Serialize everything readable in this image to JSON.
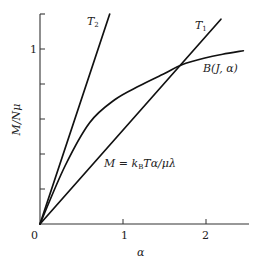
{
  "chart_data": {
    "type": "line",
    "title": "",
    "xlabel": "α",
    "ylabel": "M/Nμ",
    "xlim": [
      0,
      2.55
    ],
    "ylim": [
      0,
      1.2
    ],
    "grid": false,
    "legend": "none (inline labels)",
    "x_ticks": [
      0,
      1,
      2
    ],
    "x_tick_labels": [
      "0",
      "1",
      "2"
    ],
    "y_ticks": [
      0,
      0.2,
      0.4,
      0.6,
      0.8,
      1.0,
      1.2
    ],
    "y_tick_labels": [
      "",
      "",
      "",
      "",
      "",
      "1",
      ""
    ],
    "series": [
      {
        "name": "T2",
        "label": "T₂",
        "kind": "straight line through origin",
        "x": [
          0,
          0.84
        ],
        "y": [
          0,
          1.2
        ],
        "slope": 1.42
      },
      {
        "name": "T1",
        "label": "T₁",
        "kind": "straight line through origin",
        "x": [
          0,
          2.18
        ],
        "y": [
          0,
          1.17
        ],
        "slope": 0.535
      },
      {
        "name": "B(J, α)",
        "label": "B(J, α)",
        "kind": "saturating curve (Brillouin function)",
        "x": [
          0,
          0.3,
          0.6,
          0.9,
          1.2,
          1.5,
          1.71,
          2.0,
          2.2,
          2.45
        ],
        "y": [
          0,
          0.33,
          0.58,
          0.71,
          0.79,
          0.86,
          0.91,
          0.95,
          0.97,
          0.99
        ]
      }
    ],
    "annotations": [
      {
        "text": "M = k_B Tα/μλ",
        "refers_to": "T1 and T2 straight lines"
      },
      {
        "text": "T₂",
        "at": "top of steep line"
      },
      {
        "text": "T₁",
        "at": "top of shallow line"
      },
      {
        "text": "B(J, α)",
        "at": "right end of curve"
      }
    ]
  },
  "labels": {
    "y_axis": "M/Nμ",
    "x_axis": "α",
    "origin": "0",
    "x_tick_1": "1",
    "x_tick_2": "2",
    "y_tick_1": "1",
    "t2_main": "T",
    "t2_sub": "2",
    "t1_main": "T",
    "t1_sub": "1",
    "b_curve": "B(J, α)",
    "eq_prefix": "M = k",
    "eq_sub": "B",
    "eq_suffix": "Tα/μλ"
  }
}
